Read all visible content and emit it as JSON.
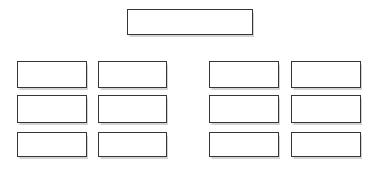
{
  "diagram": {
    "colors": {
      "background": "#ffffff",
      "box_fill": "#ffffff",
      "box_border": "#363636"
    },
    "top_box": {
      "label": ""
    },
    "left_group": {
      "boxes": [
        {
          "label": ""
        },
        {
          "label": ""
        },
        {
          "label": ""
        },
        {
          "label": ""
        },
        {
          "label": ""
        },
        {
          "label": ""
        }
      ]
    },
    "right_group": {
      "boxes": [
        {
          "label": ""
        },
        {
          "label": ""
        },
        {
          "label": ""
        },
        {
          "label": ""
        },
        {
          "label": ""
        },
        {
          "label": ""
        }
      ]
    }
  }
}
